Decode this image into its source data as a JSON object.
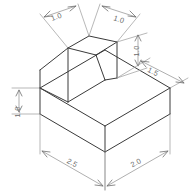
{
  "drawing": {
    "title": "Isometric solid with inclined face",
    "type": "isometric-technical-drawing",
    "background_color": "#ffffff",
    "edge_color": "#3a3a3a",
    "dimension_color": "#8d8d8d",
    "text_color": "#6b6b6b",
    "units": "inches",
    "dimensions": [
      {
        "id": "top-left-width",
        "label": "1.0",
        "value": 1.0,
        "orientation": "iso-left",
        "position": "top-left",
        "text_x": 52,
        "text_y": 21,
        "rotation": -27
      },
      {
        "id": "top-right-depth",
        "label": "1.0",
        "value": 1.0,
        "orientation": "iso-right",
        "position": "top-right",
        "text_x": 119,
        "text_y": 21,
        "rotation": 27
      },
      {
        "id": "upper-block-height",
        "label": "1.0",
        "value": 1.0,
        "orientation": "vertical",
        "position": "right-upper",
        "text_x": 139,
        "text_y": 51,
        "rotation": -90
      },
      {
        "id": "base-depth",
        "label": "1.5",
        "value": 1.5,
        "orientation": "iso-right",
        "position": "right-middle",
        "text_x": 156,
        "text_y": 75,
        "rotation": 27
      },
      {
        "id": "base-height",
        "label": "1.0",
        "value": 1.0,
        "orientation": "vertical",
        "position": "left",
        "text_x": 20,
        "text_y": 113,
        "rotation": -90
      },
      {
        "id": "base-width",
        "label": "2.5",
        "value": 2.5,
        "orientation": "iso-left",
        "position": "bottom-left",
        "text_x": 70,
        "text_y": 164,
        "rotation": 27
      },
      {
        "id": "base-length",
        "label": "2.0",
        "value": 2.0,
        "orientation": "iso-right",
        "position": "bottom-right",
        "text_x": 135,
        "text_y": 164,
        "rotation": -27
      }
    ],
    "faces": [
      {
        "id": "base-front-left",
        "name": "base front left face"
      },
      {
        "id": "base-front-right",
        "name": "base front right face"
      },
      {
        "id": "base-top",
        "name": "base top face"
      },
      {
        "id": "upper-top",
        "name": "upper block top face"
      },
      {
        "id": "upper-right",
        "name": "upper block right face"
      },
      {
        "id": "inclined",
        "name": "inclined face"
      },
      {
        "id": "upper-left",
        "name": "upper block left face"
      }
    ]
  }
}
